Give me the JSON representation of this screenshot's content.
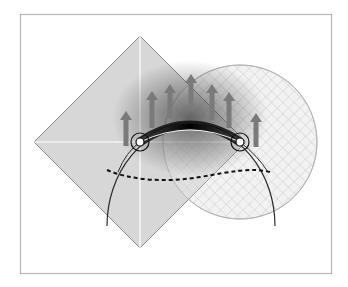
{
  "diagram": {
    "type": "geometric-illustration",
    "frame": {
      "x": 20,
      "y": 14,
      "width": 311,
      "height": 259,
      "stroke": "#b4b4b4"
    },
    "diamond": {
      "center": [
        140,
        142
      ],
      "half_diagonal": 106,
      "fill": "#d4d4d4",
      "stroke": "#8c8c8c",
      "crosshair_color": "#ffffff"
    },
    "hatched_circle": {
      "center": [
        240,
        142
      ],
      "radius": 77,
      "stroke": "#b8b8b8",
      "hatch_color": "#d6d6d6"
    },
    "large_arc": {
      "center": [
        191,
        226
      ],
      "radius": 84,
      "stroke": "#2a2a2a"
    },
    "band": {
      "from": [
        140,
        142
      ],
      "to": [
        240,
        142
      ],
      "color": "#111111"
    },
    "ring_markers": [
      {
        "center": [
          140,
          142
        ],
        "outer_r": 9,
        "inner_r": 4
      },
      {
        "center": [
          240,
          142
        ],
        "outer_r": 9,
        "inner_r": 4
      }
    ],
    "dashed_curve": {
      "stroke": "#111111",
      "points": "M107,170 C130,180 165,183 200,177 C230,172 250,167 270,172"
    },
    "arrows": [
      {
        "x": 126,
        "tail_y": 146,
        "head_y": 111
      },
      {
        "x": 152,
        "tail_y": 128,
        "head_y": 91
      },
      {
        "x": 170,
        "tail_y": 118,
        "head_y": 84
      },
      {
        "x": 191,
        "tail_y": 108,
        "head_y": 74
      },
      {
        "x": 212,
        "tail_y": 120,
        "head_y": 84
      },
      {
        "x": 229,
        "tail_y": 128,
        "head_y": 92
      },
      {
        "x": 256,
        "tail_y": 147,
        "head_y": 113
      }
    ],
    "arrow_color": "#7a7a7a",
    "glow": {
      "center": [
        190,
        120
      ],
      "color": "#000000"
    }
  }
}
